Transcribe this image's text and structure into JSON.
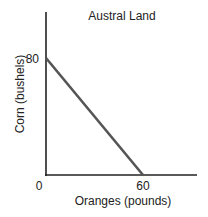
{
  "chart_data": {
    "type": "line",
    "title": "Austral Land",
    "xlabel": "Oranges (pounds)",
    "ylabel": "Corn (bushels)",
    "x": [
      0,
      60
    ],
    "series": [
      {
        "name": "Production possibilities frontier",
        "values": [
          80,
          0
        ]
      }
    ],
    "x_ticks": [
      "0",
      "60"
    ],
    "y_ticks": [
      "80"
    ],
    "xlim": [
      0,
      93
    ],
    "ylim": [
      0,
      111
    ],
    "grid": false,
    "legend": "none",
    "line_color": "#555555",
    "axis_color": "#222222"
  },
  "labels": {
    "title": "Austral Land",
    "xlabel": "Oranges (pounds)",
    "ylabel": "Corn (bushels)",
    "origin": "0",
    "x_tick_60": "60",
    "y_tick_80": "80"
  }
}
